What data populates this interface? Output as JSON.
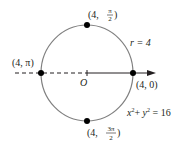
{
  "diagram": {
    "colors": {
      "circle": "#808080",
      "line": "#231f20",
      "point": "#000000"
    },
    "origin_label": "O",
    "equation_polar": "r = 4",
    "equation_cartesian": {
      "x": "x",
      "y": "y",
      "rest": "= 16"
    },
    "points": [
      {
        "label_pre": "(4, ",
        "num": "π",
        "den": "2",
        "label_post": ")"
      },
      {
        "label": "(4, π)"
      },
      {
        "label": "(4, 0)"
      },
      {
        "label_pre": "(4, ",
        "num": "3π",
        "den": "2",
        "label_post": ")"
      }
    ]
  }
}
